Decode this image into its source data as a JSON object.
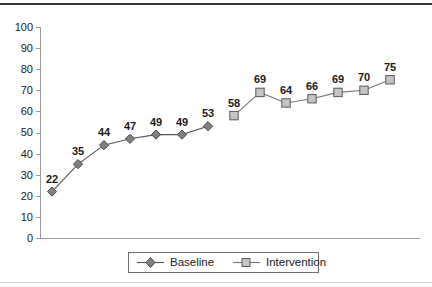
{
  "chart_data": {
    "type": "line",
    "title": "",
    "subtitle": "",
    "xlabel": "",
    "ylabel": "",
    "ylim": [
      0,
      100
    ],
    "y_ticks": [
      0,
      10,
      20,
      30,
      40,
      50,
      60,
      70,
      80,
      90,
      100
    ],
    "x_tick_labels": [],
    "grid": false,
    "legend_position": "bottom-center",
    "x": [
      1,
      2,
      3,
      4,
      5,
      6,
      7,
      8,
      9,
      10,
      11,
      12,
      13,
      14
    ],
    "series": [
      {
        "name": "Baseline",
        "marker": "diamond",
        "marker_fill": "#808080",
        "marker_stroke": "#4a4a4a",
        "line_color": "#555555",
        "x": [
          1,
          2,
          3,
          4,
          5,
          6,
          7
        ],
        "values": [
          22,
          35,
          44,
          47,
          49,
          49,
          53
        ],
        "labels": [
          "22",
          "35",
          "44",
          "47",
          "49",
          "49",
          "53"
        ]
      },
      {
        "name": "Intervention",
        "marker": "square",
        "marker_fill": "#c4c4c4",
        "marker_stroke": "#5a5a5a",
        "line_color": "#777777",
        "x": [
          8,
          9,
          10,
          11,
          12,
          13,
          14
        ],
        "values": [
          58,
          69,
          64,
          66,
          69,
          70,
          75
        ],
        "labels": [
          "58",
          "69",
          "64",
          "66",
          "69",
          "70",
          "75"
        ]
      }
    ],
    "annotations": []
  },
  "legend": {
    "items": [
      {
        "label": "Baseline",
        "marker": "diamond"
      },
      {
        "label": "Intervention",
        "marker": "square"
      }
    ]
  },
  "axis": {
    "y_tick_labels": [
      "100",
      "90",
      "80",
      "70",
      "60",
      "50",
      "40",
      "30",
      "20",
      "10",
      "0"
    ]
  },
  "colors": {
    "axis": "#9a9a9a",
    "text": "#1a1a1a",
    "baseline_marker": "#808080",
    "intervention_marker": "#c4c4c4",
    "line": "#555555",
    "frame_top": "#3a3a3a",
    "frame_bottom": "#cfcfcf"
  }
}
